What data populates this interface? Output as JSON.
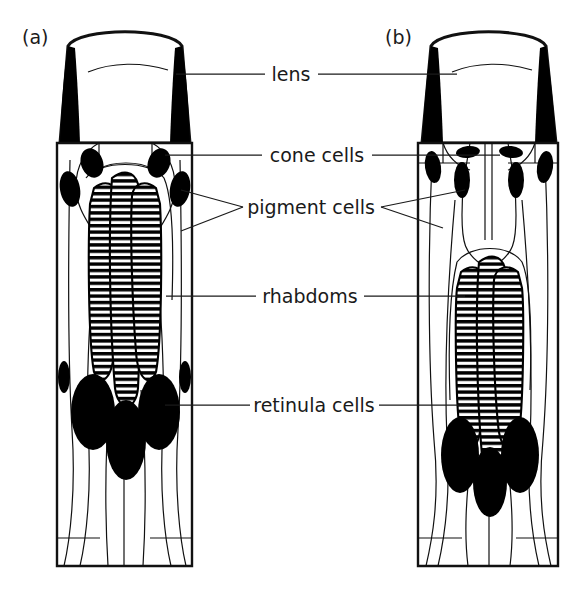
{
  "figure": {
    "background_color": "#ffffff",
    "ink_color": "#1a1a1a",
    "width": 583,
    "height": 590
  },
  "panels": [
    {
      "id": "a",
      "tag": "(a)",
      "tag_x": 22,
      "tag_y": 44,
      "type": "apposition-ommatidium"
    },
    {
      "id": "b",
      "tag": "(b)",
      "tag_x": 385,
      "tag_y": 44,
      "type": "superposition-ommatidium"
    }
  ],
  "labels": [
    {
      "id": "lens",
      "text": "lens",
      "text_x": 291,
      "text_y": 81,
      "leader_y": 74,
      "left_line": {
        "x1": 176,
        "x2": 265
      },
      "right_line": {
        "x1": 318,
        "x2": 457
      }
    },
    {
      "id": "cone-cells",
      "text": "cone cells",
      "text_x": 317,
      "text_y": 162,
      "leader_y": 155,
      "left_line": {
        "x1": 165,
        "x2": 262
      },
      "right_line": {
        "x1": 372,
        "x2": 500
      }
    },
    {
      "id": "pigment-cells",
      "text": "pigment cells",
      "text_x": 311,
      "text_y": 214,
      "leader_y": 207,
      "branch_left": [
        {
          "x1": 243,
          "y1": 207,
          "x2": 181,
          "y2": 190
        },
        {
          "x1": 243,
          "y1": 207,
          "x2": 181,
          "y2": 231
        }
      ],
      "branch_right": [
        {
          "x1": 381,
          "y1": 207,
          "x2": 465,
          "y2": 190
        },
        {
          "x1": 381,
          "y1": 207,
          "x2": 443,
          "y2": 228
        }
      ]
    },
    {
      "id": "rhabdoms",
      "text": "rhabdoms",
      "text_x": 263,
      "text_y": 303,
      "leader_y": 296,
      "left_line": {
        "x1": 166,
        "x2": 256
      },
      "right_line": {
        "x1": 364,
        "x2": 465
      }
    },
    {
      "id": "retinula-cells",
      "text": "retinula cells",
      "text_x": 258,
      "text_y": 412,
      "leader_y": 405,
      "left_line": {
        "x1": 165,
        "x2": 250
      },
      "right_line": {
        "x1": 379,
        "x2": 470
      }
    }
  ],
  "colors": {
    "pigment_granule": "#000000",
    "lens_wedge": "#000000",
    "outline": "#111111",
    "text": "#1a1a1a",
    "page": "#ffffff"
  },
  "geometry": {
    "panel_a": {
      "left": 57,
      "right": 192,
      "lens_top": 24,
      "lens_bottom": 143,
      "body_bottom": 566,
      "rhabdom_top": 165,
      "rhabdom_bottom": 392
    },
    "panel_b": {
      "left": 418,
      "right": 558,
      "lens_top": 24,
      "lens_bottom": 143,
      "body_bottom": 566,
      "rhabdom_top": 243,
      "rhabdom_bottom": 458
    }
  }
}
